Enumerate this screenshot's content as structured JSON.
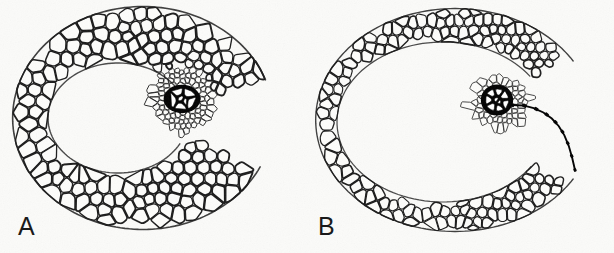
{
  "figure": {
    "type": "scientific-line-drawing",
    "width": 614,
    "height": 253,
    "background_color": "#fbfbf9",
    "ink_color": "#1a1a1a",
    "cell_fill_color": "#fdfdfb",
    "xylem_wall_color": "#000000",
    "xylem_lumen_color": "#ffffff"
  },
  "panels": [
    {
      "id": "A",
      "label": "A",
      "label_x": 18,
      "label_y": 214,
      "description": "open-ring section with thick parenchyma cortex, large central lacuna, and one vascular bundle with 7 large xylem vessels",
      "center": {
        "x": 143,
        "y": 118
      },
      "outer_radius": {
        "x": 131,
        "y": 112
      },
      "inner_radius": {
        "x": 70,
        "y": 55
      },
      "inner_center": {
        "x": 118,
        "y": 118
      },
      "cell_size": 13.5,
      "wall_width": 1.5,
      "gap_angle_start": -18,
      "gap_angle_end": 24,
      "bundle": {
        "center": {
          "x": 182,
          "y": 100
        },
        "sheath_radius": {
          "x": 31,
          "y": 33
        },
        "sheath_cell_size": 5.2,
        "xylem_center": {
          "x": 182,
          "y": 99
        },
        "xylem_radius": {
          "x": 15,
          "y": 11
        },
        "xylem_vessel_count": 7,
        "xylem_wall_width": 2.6
      }
    },
    {
      "id": "B",
      "label": "B",
      "label_x": 318,
      "label_y": 214,
      "description": "open-ring section with thinner multi-layered cortex, larger central lacuna, vascular bundle with 9 rounded xylem vessels and a dark vascular trace running to the outer margin",
      "center": {
        "x": 455,
        "y": 120
      },
      "outer_radius": {
        "x": 140,
        "y": 112
      },
      "inner_radius": {
        "x": 106,
        "y": 80
      },
      "inner_center": {
        "x": 443,
        "y": 122
      },
      "cell_size": 10.2,
      "wall_width": 1.3,
      "gap_angle_start": -30,
      "gap_angle_end": 30,
      "bundle": {
        "center": {
          "x": 500,
          "y": 103
        },
        "sheath_radius": {
          "x": 30,
          "y": 27
        },
        "sheath_cell_size": 5.0,
        "xylem_center": {
          "x": 497,
          "y": 100
        },
        "xylem_radius": {
          "x": 13,
          "y": 12
        },
        "xylem_vessel_count": 9,
        "xylem_wall_width": 3.0,
        "trace": {
          "present": true,
          "from": {
            "x": 512,
            "y": 105
          },
          "to": {
            "x": 575,
            "y": 170
          },
          "segment_count": 9,
          "color": "#000000"
        }
      }
    }
  ],
  "render": {
    "seed_a": 20250419,
    "seed_b": 77310942,
    "jitter": 0.34,
    "relax_iterations": 2
  }
}
